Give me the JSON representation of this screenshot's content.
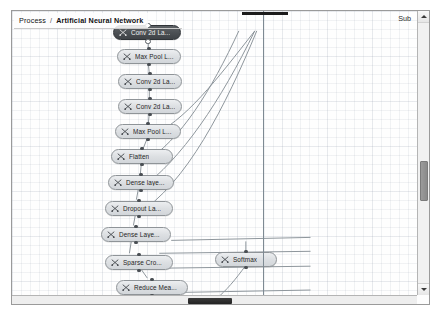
{
  "window": {
    "breadcrumb": {
      "root_label": "Process",
      "separator": "/",
      "current_label": "Artificial Neural Network"
    },
    "top_right_label": "Sub"
  },
  "graph": {
    "node_icon_name": "operator-icon",
    "nodes": [
      {
        "id": "conv2d_1",
        "label": "Conv 2d La...",
        "selected": true,
        "x": 101,
        "y": 14,
        "w": 68
      },
      {
        "id": "maxpool_1",
        "label": "Max Pool L...",
        "selected": false,
        "x": 105,
        "y": 38,
        "w": 64
      },
      {
        "id": "conv2d_2",
        "label": "Conv 2d La...",
        "selected": false,
        "x": 106,
        "y": 63,
        "w": 64
      },
      {
        "id": "conv2d_3",
        "label": "Conv 2d La...",
        "selected": false,
        "x": 106,
        "y": 88,
        "w": 64
      },
      {
        "id": "maxpool_2",
        "label": "Max Pool L...",
        "selected": false,
        "x": 103,
        "y": 113,
        "w": 66
      },
      {
        "id": "flatten",
        "label": "Flatten",
        "selected": false,
        "x": 99,
        "y": 138,
        "w": 62
      },
      {
        "id": "dense_1",
        "label": "Dense laye...",
        "selected": false,
        "x": 96,
        "y": 164,
        "w": 66
      },
      {
        "id": "dropout",
        "label": "Dropout La...",
        "selected": false,
        "x": 93,
        "y": 190,
        "w": 68
      },
      {
        "id": "dense_2",
        "label": "Dense Laye...",
        "selected": false,
        "x": 89,
        "y": 216,
        "w": 70
      },
      {
        "id": "sparse_cro",
        "label": "Sparse Cro...",
        "selected": false,
        "x": 93,
        "y": 244,
        "w": 68
      },
      {
        "id": "reduce_mean",
        "label": "Reduce Mea...",
        "selected": false,
        "x": 104,
        "y": 269,
        "w": 72
      },
      {
        "id": "softmax",
        "label": "Softmax",
        "selected": false,
        "x": 203,
        "y": 241,
        "w": 62
      }
    ],
    "selection_bar_visible": true,
    "guide_line_visible": true
  },
  "scrollbars": {
    "vertical": {
      "up_arrow": "scroll-up",
      "down_arrow": "scroll-down",
      "thumb_top": 150,
      "thumb_height": 40
    },
    "horizontal": {
      "thumb_left": 176,
      "thumb_width": 44
    }
  }
}
